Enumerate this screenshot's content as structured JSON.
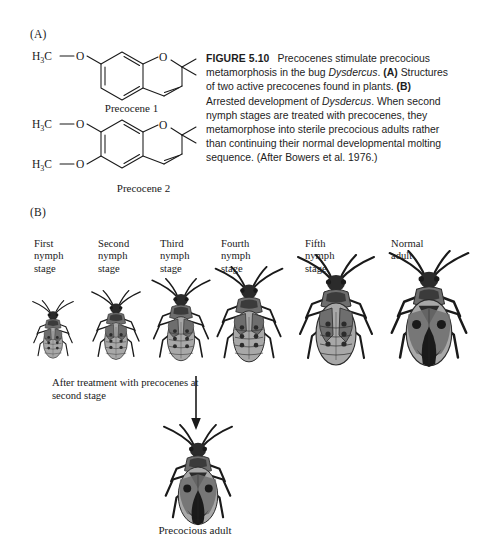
{
  "panels": {
    "a_label": "(A)",
    "b_label": "(B)"
  },
  "caption": {
    "figure_number": "FIGURE 5.10",
    "text_1": "Precocenes stimulate precocious metamorphosis in the bug ",
    "italic_1": "Dysdercus",
    "text_2": ". ",
    "bold_a": "(A)",
    "text_3": " Structures of two active precocenes found in plants. ",
    "bold_b": "(B)",
    "text_4": " Arrested development of ",
    "italic_2": "Dysdercus",
    "text_5": ". When second nymph stages are treated with precocenes, they metamorphose into sterile precocious adults rather than continuing their normal developmental molting sequence. (After Bowers et al. 1976.)"
  },
  "chemistry": {
    "precocene_1": {
      "name": "Precocene 1",
      "methoxy_label": "H₃C",
      "o_link": "O",
      "ring_oxygen": "O"
    },
    "precocene_2": {
      "name": "Precocene 2",
      "methoxy_label_top": "H₃C",
      "methoxy_label_bottom": "H₃C",
      "o_link_top": "O",
      "o_link_bottom": "O",
      "ring_oxygen": "O"
    }
  },
  "stages": [
    {
      "id": "first-nymph",
      "label": "First\nnymph\nstage",
      "label_x": 34,
      "label_y": 238,
      "bug_x": 26,
      "bug_y": 300,
      "bug_w": 54,
      "bug_h": 62,
      "morph": "nymph"
    },
    {
      "id": "second-nymph",
      "label": "Second\nnymph\nstage",
      "label_x": 98,
      "label_y": 238,
      "bug_x": 84,
      "bug_y": 290,
      "bug_w": 64,
      "bug_h": 74,
      "morph": "nymph"
    },
    {
      "id": "third-nymph",
      "label": "Third\nnymph\nstage",
      "label_x": 160,
      "label_y": 238,
      "bug_x": 143,
      "bug_y": 278,
      "bug_w": 76,
      "bug_h": 88,
      "morph": "nymph"
    },
    {
      "id": "fourth-nymph",
      "label": "Fourth\nnymph\nstage",
      "label_x": 221,
      "label_y": 238,
      "bug_x": 205,
      "bug_y": 266,
      "bug_w": 88,
      "bug_h": 102,
      "morph": "nymph"
    },
    {
      "id": "fifth-nymph",
      "label": "Fifth\nnymph\nstage",
      "label_x": 305,
      "label_y": 238,
      "bug_x": 286,
      "bug_y": 254,
      "bug_w": 100,
      "bug_h": 116,
      "morph": "nymph-late"
    },
    {
      "id": "normal-adult",
      "label": "Normal\nadult",
      "label_x": 391,
      "label_y": 238,
      "bug_x": 377,
      "bug_y": 250,
      "bug_w": 104,
      "bug_h": 120,
      "morph": "adult"
    }
  ],
  "treatment": {
    "note": "After treatment with precocenes at second stage",
    "arrow": "down-arrow",
    "result_label": "Precocious adult",
    "bug_x": 152,
    "bug_y": 424,
    "bug_w": 92,
    "bug_h": 104,
    "morph": "adult"
  },
  "colors": {
    "ink": "#1a1a1a",
    "caption_ink": "#1d1d1d",
    "body_dark": "#2b2b2b",
    "body_mid": "#6e6e6e",
    "body_light": "#a8a8a8",
    "background": "#ffffff"
  }
}
